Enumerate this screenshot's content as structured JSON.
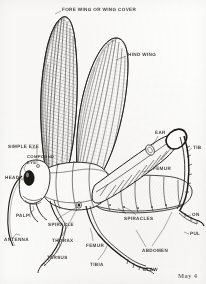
{
  "figure": {
    "style": "engraved line drawing",
    "background_color": "#fdfdfc",
    "ink_color": "#2b2722",
    "caption": "May 4"
  },
  "labels": [
    {
      "id": "fore-wing",
      "text": "FORE WING OR WING COVER",
      "x": 62,
      "y": 8,
      "anchor": "left"
    },
    {
      "id": "hind-wing",
      "text": "HIND WING",
      "x": 128,
      "y": 53,
      "anchor": "left"
    },
    {
      "id": "ear",
      "text": "EAR",
      "x": 155,
      "y": 131,
      "anchor": "left"
    },
    {
      "id": "tibia-hind",
      "text": "TIB",
      "x": 193,
      "y": 146,
      "anchor": "left"
    },
    {
      "id": "simple-eye",
      "text": "SIMPLE EYE",
      "x": 8,
      "y": 145,
      "anchor": "left"
    },
    {
      "id": "compound-eye",
      "text": "COMPOUND",
      "x": 27,
      "y": 155,
      "anchor": "left"
    },
    {
      "id": "compound-eye2",
      "text": "EYE",
      "x": 27,
      "y": 161,
      "anchor": "left"
    },
    {
      "id": "femur-hind",
      "text": "FEMUR",
      "x": 153,
      "y": 167,
      "anchor": "left"
    },
    {
      "id": "head",
      "text": "HEAD",
      "x": 5,
      "y": 176,
      "anchor": "left"
    },
    {
      "id": "palpi",
      "text": "PALPI",
      "x": 16,
      "y": 214,
      "anchor": "left"
    },
    {
      "id": "spiracle",
      "text": "SPIRACLE",
      "x": 48,
      "y": 223,
      "anchor": "left"
    },
    {
      "id": "spiracles",
      "text": "SPIRACLES",
      "x": 124,
      "y": 217,
      "anchor": "left"
    },
    {
      "id": "tarsus-hind",
      "text": "ON",
      "x": 192,
      "y": 213,
      "anchor": "left"
    },
    {
      "id": "pulvillus",
      "text": "PUL",
      "x": 190,
      "y": 232,
      "anchor": "left"
    },
    {
      "id": "antenna",
      "text": "ANTENNA",
      "x": 4,
      "y": 238,
      "anchor": "left"
    },
    {
      "id": "thorax",
      "text": "THORAX",
      "x": 52,
      "y": 239,
      "anchor": "left"
    },
    {
      "id": "femur-mid",
      "text": "FEMUR",
      "x": 86,
      "y": 244,
      "anchor": "left"
    },
    {
      "id": "abdomen",
      "text": "ABDOMEN",
      "x": 142,
      "y": 249,
      "anchor": "left"
    },
    {
      "id": "tarsus",
      "text": "TARSUS",
      "x": 47,
      "y": 256,
      "anchor": "left"
    },
    {
      "id": "tibia-mid",
      "text": "TIBIA",
      "x": 90,
      "y": 263,
      "anchor": "left"
    },
    {
      "id": "claw",
      "text": "CLAW",
      "x": 143,
      "y": 268,
      "anchor": "left"
    }
  ]
}
